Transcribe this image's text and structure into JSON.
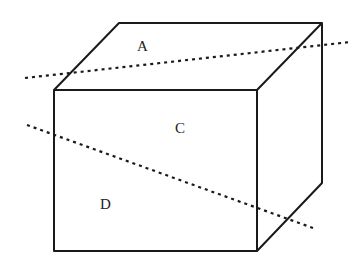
{
  "figure": {
    "type": "cuboid-with-cutting-lines",
    "labels": {
      "top_face": "A",
      "front_upper": "C",
      "front_lower": "D"
    },
    "lines": {
      "upper_dotted": "dotted line crossing top face",
      "lower_dotted": "dotted line crossing front and right faces"
    }
  }
}
